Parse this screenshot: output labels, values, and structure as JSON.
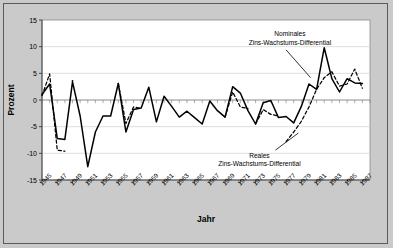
{
  "figure": {
    "background_color": "#cacaca",
    "plot_background_color": "#ffffff",
    "border_color": "#5a5a5a",
    "series_color": "#000000"
  },
  "chart_data": {
    "type": "line",
    "title": "",
    "xlabel": "Jahr",
    "ylabel": "Prozent",
    "ylim": [
      -15,
      15
    ],
    "yticks": [
      15,
      10,
      5,
      0,
      -5,
      -10,
      -15
    ],
    "ytick_labels": [
      "15",
      "10",
      "5",
      "0",
      "-5",
      "-10",
      "-15"
    ],
    "xlim": [
      1945,
      1988
    ],
    "xtick_labels": [
      "1945",
      "1947",
      "1949",
      "1951",
      "1953",
      "1955",
      "1957",
      "1959",
      "1961",
      "1963",
      "1965",
      "1967",
      "1969",
      "1971",
      "1973",
      "1975",
      "1977",
      "1979",
      "1981",
      "1983",
      "1985",
      "1987"
    ],
    "xticks": [
      1945,
      1947,
      1949,
      1951,
      1953,
      1955,
      1957,
      1959,
      1961,
      1963,
      1965,
      1967,
      1969,
      1971,
      1973,
      1975,
      1977,
      1979,
      1981,
      1983,
      1985,
      1987
    ],
    "grid": true,
    "grid_axis": "y",
    "legend_position": "inline-annotations",
    "series": [
      {
        "name": "Nominales Zins-Wachstums-Differential",
        "style": "solid",
        "x": [
          1945,
          1946,
          1947,
          1948,
          1949,
          1950,
          1951,
          1952,
          1953,
          1954,
          1955,
          1956,
          1957,
          1958,
          1959,
          1960,
          1961,
          1962,
          1963,
          1964,
          1965,
          1966,
          1967,
          1968,
          1969,
          1970,
          1971,
          1972,
          1973,
          1974,
          1975,
          1976,
          1977,
          1978,
          1979,
          1980,
          1981,
          1982,
          1983,
          1984,
          1985,
          1986,
          1987
        ],
        "values": [
          1.0,
          3.0,
          -7.2,
          -7.4,
          3.4,
          -3.0,
          -12.5,
          -6.0,
          -3.0,
          -3.0,
          3.1,
          -6.0,
          -1.8,
          -1.5,
          2.4,
          -4.1,
          0.7,
          -1.2,
          -3.2,
          -2.1,
          -3.3,
          -4.5,
          -0.2,
          -2.0,
          -3.2,
          2.5,
          1.3,
          -2.0,
          -4.5,
          -0.5,
          -0.1,
          -3.3,
          -3.1,
          -4.3,
          -1.2,
          3.0,
          2.0,
          9.8,
          4.0,
          1.5,
          4.0,
          3.2,
          3.1
        ]
      },
      {
        "name": "Reales Zins-Wachstums-Differential",
        "style": "dashed",
        "segments": [
          {
            "x": [
              1945,
              1946,
              1947,
              1948
            ],
            "values": [
              0.8,
              4.9,
              -9.4,
              -9.6
            ]
          },
          {
            "x": [
              1949
            ],
            "values": [
              3.6
            ]
          },
          {
            "x": [
              1955,
              1956,
              1957,
              1958
            ],
            "values": [
              3.1,
              -4.4,
              -1.3,
              -1.6
            ]
          },
          {
            "x": [
              1969,
              1970,
              1971,
              1972
            ],
            "values": [
              -3.2,
              1.5,
              -1.3,
              -1.6
            ]
          },
          {
            "x": [
              1973,
              1974,
              1975,
              1976
            ],
            "values": [
              -4.5,
              -1.8,
              -2.7,
              -3.0
            ]
          },
          {
            "x": [
              1977,
              1978,
              1979,
              1980,
              1981,
              1982,
              1983,
              1984,
              1985,
              1986,
              1987
            ],
            "values": [
              -7.8,
              -6.0,
              -4.0,
              -1.3,
              2.0,
              4.2,
              5.3,
              2.6,
              3.0,
              5.8,
              2.2
            ]
          }
        ]
      }
    ],
    "annotations": [
      {
        "id": "annotation-nominal",
        "line1": "Nominales",
        "line2": "Zins-Wachstums-Differential",
        "text_x": 1977.5,
        "text_y": 12.0,
        "leader_from_x": 1977.0,
        "leader_from_y": 9.4,
        "leader_to_x": 1980.2,
        "leader_to_y": 4.2
      },
      {
        "id": "annotation-real",
        "line1": "Reales",
        "line2": "Zins-Wachstums-Differential",
        "text_x": 1973.5,
        "text_y": -10.8,
        "leader_from_x": 1975.6,
        "leader_from_y": -9.4,
        "leader_to_x": 1978.6,
        "leader_to_y": -6.2
      }
    ]
  }
}
